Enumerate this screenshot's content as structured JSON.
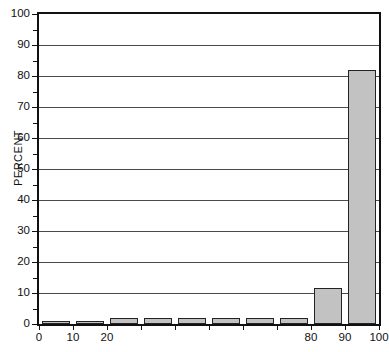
{
  "chart_data": {
    "type": "bar",
    "title": "",
    "subtitle": "",
    "xlabel": "",
    "ylabel": "PERCENT",
    "xlim": [
      0,
      100
    ],
    "ylim": [
      0,
      100
    ],
    "grid": true,
    "legend": null,
    "bin_width": 10,
    "bin_edges": [
      0,
      10,
      20,
      30,
      40,
      50,
      60,
      70,
      80,
      90,
      100
    ],
    "categories": [
      "0-10",
      "10-20",
      "20-30",
      "30-40",
      "40-50",
      "50-60",
      "60-70",
      "70-80",
      "80-90",
      "90-100"
    ],
    "values": [
      1,
      1,
      2,
      2,
      2,
      2,
      2,
      2,
      11.5,
      82
    ],
    "x_tick_values": [
      0,
      10,
      20,
      30,
      40,
      50,
      60,
      70,
      80,
      90,
      100
    ],
    "x_tick_labels": [
      "0",
      "10",
      "20",
      "",
      "",
      "",
      "",
      "",
      "80",
      "90",
      "100"
    ],
    "y_tick_values": [
      0,
      10,
      20,
      30,
      40,
      50,
      60,
      70,
      80,
      90,
      100
    ],
    "y_tick_labels": [
      "0",
      "10",
      "20",
      "30",
      "40",
      "50",
      "60",
      "70",
      "80",
      "90",
      "100"
    ],
    "y_minor_tick_values": [
      5,
      15,
      25,
      35,
      45,
      55,
      65,
      75,
      85,
      95
    ],
    "bar_fill_color": "#c2c2c2",
    "bar_edge_color": "#232323",
    "grid_color": "#4a4a4a",
    "axis_color": "#111111",
    "background_color": "#ffffff"
  }
}
